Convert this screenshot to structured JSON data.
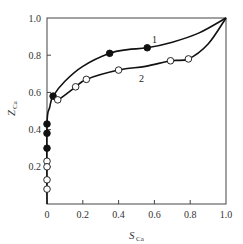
{
  "chart_data": {
    "type": "line",
    "title": "",
    "xlabel": "S_Ca",
    "ylabel": "Z_Ca",
    "xlim": [
      0,
      1.0
    ],
    "ylim": [
      0,
      1.0
    ],
    "grid": false,
    "legend": "inline curve labels",
    "x_ticks": [
      "0",
      "0.2",
      "0.4",
      "0.6",
      "0.8",
      "1.0"
    ],
    "y_ticks": [
      "0.2",
      "0.4",
      "0.6",
      "0.8",
      "1.0"
    ],
    "series": [
      {
        "name": "1",
        "marker": "filled-circle",
        "curve": [
          [
            0.0,
            0.0
          ],
          [
            0.0,
            0.43
          ],
          [
            0.015,
            0.52
          ],
          [
            0.034,
            0.58
          ],
          [
            0.1,
            0.66
          ],
          [
            0.2,
            0.74
          ],
          [
            0.35,
            0.81
          ],
          [
            0.45,
            0.83
          ],
          [
            0.56,
            0.84
          ],
          [
            0.7,
            0.87
          ],
          [
            0.85,
            0.92
          ],
          [
            1.0,
            1.0
          ]
        ],
        "points": [
          [
            0.0,
            0.43
          ],
          [
            0.0,
            0.38
          ],
          [
            0.0,
            0.3
          ],
          [
            0.034,
            0.58
          ],
          [
            0.35,
            0.81
          ],
          [
            0.56,
            0.84
          ]
        ]
      },
      {
        "name": "2",
        "marker": "open-circle",
        "curve": [
          [
            0.034,
            0.58
          ],
          [
            0.06,
            0.56
          ],
          [
            0.16,
            0.63
          ],
          [
            0.22,
            0.67
          ],
          [
            0.4,
            0.72
          ],
          [
            0.55,
            0.74
          ],
          [
            0.69,
            0.77
          ],
          [
            0.79,
            0.78
          ],
          [
            0.9,
            0.86
          ],
          [
            1.0,
            1.0
          ]
        ],
        "points": [
          [
            0.0,
            0.23
          ],
          [
            0.0,
            0.2
          ],
          [
            0.0,
            0.13
          ],
          [
            0.0,
            0.08
          ],
          [
            0.06,
            0.56
          ],
          [
            0.16,
            0.63
          ],
          [
            0.22,
            0.67
          ],
          [
            0.4,
            0.72
          ],
          [
            0.69,
            0.77
          ],
          [
            0.79,
            0.78
          ]
        ]
      }
    ]
  },
  "labels": {
    "x_main": "S",
    "x_sub": "Ca",
    "y_main": "Z",
    "y_sub": "Ca",
    "curve1": "1",
    "curve2": "2"
  }
}
